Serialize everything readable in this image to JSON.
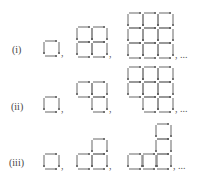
{
  "rows": [
    {
      "label": "(i)",
      "label_x": 12,
      "label_y": 44,
      "figures": [
        {
          "cells": [
            [
              44,
              41
            ]
          ],
          "sep": ","
        },
        {
          "cells": [
            [
              77,
              27
            ],
            [
              92,
              27
            ],
            [
              77,
              42
            ],
            [
              92,
              42
            ]
          ],
          "sep": ","
        },
        {
          "cells": [
            [
              128,
              13
            ],
            [
              143,
              13
            ],
            [
              158,
              13
            ],
            [
              128,
              28
            ],
            [
              143,
              28
            ],
            [
              158,
              28
            ],
            [
              128,
              43
            ],
            [
              143,
              43
            ],
            [
              158,
              43
            ]
          ],
          "sep": ", ..."
        }
      ]
    },
    {
      "label": "(ii)",
      "label_x": 11,
      "label_y": 101,
      "figures": [
        {
          "cells": [
            [
              44,
              97
            ]
          ],
          "sep": ","
        },
        {
          "cells": [
            [
              77,
              82
            ],
            [
              92,
              82
            ],
            [
              92,
              97
            ]
          ],
          "sep": ","
        },
        {
          "cells": [
            [
              128,
              67
            ],
            [
              143,
              67
            ],
            [
              158,
              67
            ],
            [
              128,
              82
            ],
            [
              143,
              82
            ],
            [
              158,
              82
            ],
            [
              143,
              97
            ],
            [
              158,
              97
            ]
          ],
          "sep": ", ..."
        }
      ]
    },
    {
      "label": "(iii)",
      "label_x": 9,
      "label_y": 157,
      "figures": [
        {
          "cells": [
            [
              44,
              154
            ]
          ],
          "sep": ","
        },
        {
          "cells": [
            [
              92,
              139
            ],
            [
              77,
              154
            ],
            [
              92,
              154
            ]
          ],
          "sep": ","
        },
        {
          "cells": [
            [
              156,
              124
            ],
            [
              156,
              139
            ],
            [
              128,
              154
            ],
            [
              142,
              154
            ],
            [
              156,
              154
            ]
          ],
          "sep": ", ..."
        }
      ]
    }
  ],
  "cell_size": 15,
  "stroke_color": "#8a8a8a"
}
